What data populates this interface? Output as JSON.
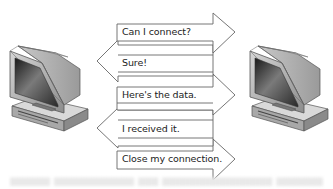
{
  "diagram": {
    "type": "handshake-sequence",
    "left_node": {
      "label": "client-computer",
      "icon": "desktop-computer-icon"
    },
    "right_node": {
      "label": "server-computer",
      "icon": "desktop-computer-icon"
    },
    "messages": [
      {
        "text": "Can I connect?",
        "direction": "right"
      },
      {
        "text": "Sure!",
        "direction": "left"
      },
      {
        "text": "Here's the data.",
        "direction": "right"
      },
      {
        "text": "I received it.",
        "direction": "left"
      },
      {
        "text": "Close my connection.",
        "direction": "right"
      }
    ],
    "colors": {
      "arrow_stroke": "#666666",
      "arrow_fill": "#ffffff",
      "text": "#222222",
      "background": "#ffffff"
    }
  }
}
